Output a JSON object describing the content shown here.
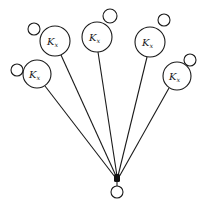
{
  "diagram": {
    "type": "star-graph",
    "hub": {
      "x": 117,
      "y": 178,
      "r": 3
    },
    "root": {
      "x": 117,
      "y": 192,
      "r": 6
    },
    "nodes": [
      {
        "id": "node-upper-left",
        "label": "K",
        "sub": "x",
        "cx": 55,
        "cy": 41,
        "r": 15,
        "loop": {
          "cx": 34,
          "cy": 29,
          "r": 6
        }
      },
      {
        "id": "node-top-center",
        "label": "K",
        "sub": "x",
        "cx": 97,
        "cy": 37,
        "r": 15,
        "loop": {
          "cx": 110,
          "cy": 16,
          "r": 7
        }
      },
      {
        "id": "node-top-right",
        "label": "K",
        "sub": "x",
        "cx": 150,
        "cy": 42,
        "r": 15,
        "loop": {
          "cx": 164,
          "cy": 20,
          "r": 6
        }
      },
      {
        "id": "node-left",
        "label": "K",
        "sub": "x",
        "cx": 37,
        "cy": 74,
        "r": 14,
        "loop": {
          "cx": 17,
          "cy": 70,
          "r": 6
        }
      },
      {
        "id": "node-right",
        "label": "K",
        "sub": "x",
        "cx": 177,
        "cy": 76,
        "r": 14,
        "loop": {
          "cx": 190,
          "cy": 60,
          "r": 6
        }
      }
    ],
    "labels": {
      "n0": "K",
      "n0s": "x",
      "n1": "K",
      "n1s": "x",
      "n2": "K",
      "n2s": "x",
      "n3": "K",
      "n3s": "x",
      "n4": "K",
      "n4s": "x"
    }
  }
}
